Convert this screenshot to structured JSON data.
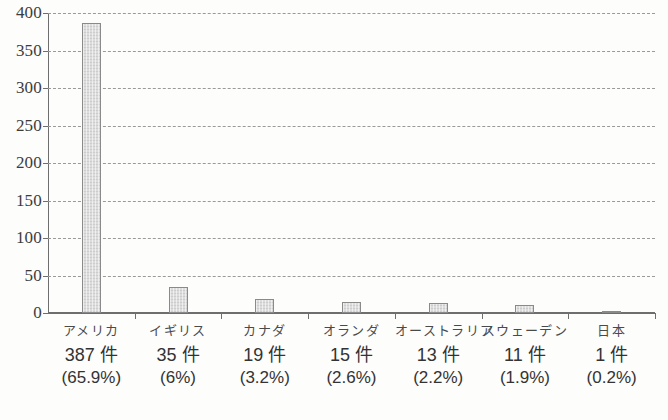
{
  "chart_data": {
    "type": "bar",
    "title": "",
    "subtitle": "",
    "xlabel": "",
    "ylabel": "",
    "ylim": [
      0,
      400
    ],
    "ytick_step": 50,
    "yticks": [
      "400",
      "350",
      "300",
      "250",
      "200",
      "150",
      "100",
      "50",
      "0"
    ],
    "grid": "horizontal-dashed",
    "legend": "none",
    "categories": [
      "アメリカ",
      "イギリス",
      "カナダ",
      "オランダ",
      "オーストラリア",
      "スウェーデン",
      "日本"
    ],
    "values": [
      387,
      35,
      19,
      15,
      13,
      11,
      1
    ],
    "count_labels": [
      "387 件",
      "35 件",
      "19 件",
      "15 件",
      "13 件",
      "11 件",
      "1 件"
    ],
    "percent_labels": [
      "(65.9%)",
      "(6%)",
      "(3.2%)",
      "(2.6%)",
      "(2.2%)",
      "(1.9%)",
      "(0.2%)"
    ],
    "percent_values": [
      65.9,
      6,
      3.2,
      2.6,
      2.2,
      1.9,
      0.2
    ],
    "colors": {
      "bar_fill": "#dcdcdc",
      "bar_border": "#8a8a8a",
      "axis": "#6e6e6e",
      "gridline": "#9a9a9a",
      "text": "#3a3a3a",
      "background": "#fdfdfc"
    }
  }
}
